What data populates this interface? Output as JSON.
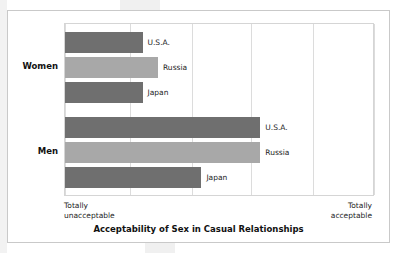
{
  "figure": {
    "title": "Acceptability of Sex in Casual Relationships",
    "axis_low_label": "Totally\nunacceptable",
    "axis_high_label": "Totally\nacceptable",
    "group_labels": [
      "Women",
      "Men"
    ]
  },
  "colors": {
    "bar_dark": "#6f6f6f",
    "bar_light": "#a8a8a8",
    "frame_border": "#c9c9c9",
    "plot_border": "#d5d5d5",
    "gridline": "#dcdcdc",
    "text": "#1d1d1d",
    "background": "#ffffff"
  },
  "chart_data": {
    "type": "bar",
    "orientation": "horizontal",
    "title": "Acceptability of Sex in Casual Relationships",
    "xlabel": "",
    "ylabel": "",
    "xlim": [
      0,
      100
    ],
    "xtick_labels": [
      "Totally unacceptable",
      "Totally acceptable"
    ],
    "grid": true,
    "gridline_positions": [
      0,
      21,
      41,
      60,
      80,
      100
    ],
    "legend": "none",
    "categories": [
      "Women",
      "Men"
    ],
    "series": [
      {
        "name": "U.S.A.",
        "color": "#6f6f6f",
        "values": [
          25,
          63
        ]
      },
      {
        "name": "Russia",
        "color": "#a8a8a8",
        "values": [
          30,
          63
        ]
      },
      {
        "name": "Japan",
        "color": "#6f6f6f",
        "values": [
          25,
          44
        ]
      }
    ],
    "bars": [
      {
        "group": "Women",
        "label": "U.S.A.",
        "value": 25,
        "color": "#6f6f6f"
      },
      {
        "group": "Women",
        "label": "Russia",
        "value": 30,
        "color": "#a8a8a8"
      },
      {
        "group": "Women",
        "label": "Japan",
        "value": 25,
        "color": "#6f6f6f"
      },
      {
        "group": "Men",
        "label": "U.S.A.",
        "value": 63,
        "color": "#6f6f6f"
      },
      {
        "group": "Men",
        "label": "Russia",
        "value": 63,
        "color": "#a8a8a8"
      },
      {
        "group": "Men",
        "label": "Japan",
        "value": 44,
        "color": "#6f6f6f"
      }
    ],
    "annotations": [
      "U.S.A.",
      "Russia",
      "Japan",
      "U.S.A.",
      "Russia",
      "Japan"
    ]
  }
}
